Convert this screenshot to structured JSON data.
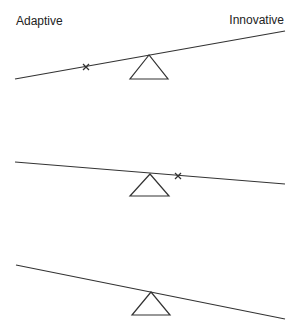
{
  "labels": {
    "left": "Adaptive",
    "right": "Innovative"
  },
  "colors": {
    "line": "#333333",
    "background": "#ffffff"
  },
  "seesaws": [
    {
      "id": "seesaw-1",
      "tilt": "left-down",
      "marker": {
        "shown": true,
        "symbol": "x",
        "side": "left"
      }
    },
    {
      "id": "seesaw-2",
      "tilt": "right-down-slight",
      "marker": {
        "shown": true,
        "symbol": "x",
        "side": "right"
      }
    },
    {
      "id": "seesaw-3",
      "tilt": "right-down",
      "marker": {
        "shown": false
      }
    }
  ]
}
